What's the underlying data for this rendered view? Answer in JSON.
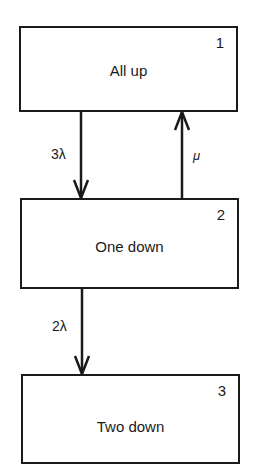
{
  "diagram": {
    "type": "state-transition",
    "states": [
      {
        "id": "1",
        "number": "1",
        "label": "All up"
      },
      {
        "id": "2",
        "number": "2",
        "label": "One down"
      },
      {
        "id": "3",
        "number": "3",
        "label": "Two down"
      }
    ],
    "transitions": [
      {
        "from": "1",
        "to": "2",
        "rate": "3λ"
      },
      {
        "from": "2",
        "to": "1",
        "rate": "μ"
      },
      {
        "from": "2",
        "to": "3",
        "rate": "2λ"
      }
    ]
  }
}
